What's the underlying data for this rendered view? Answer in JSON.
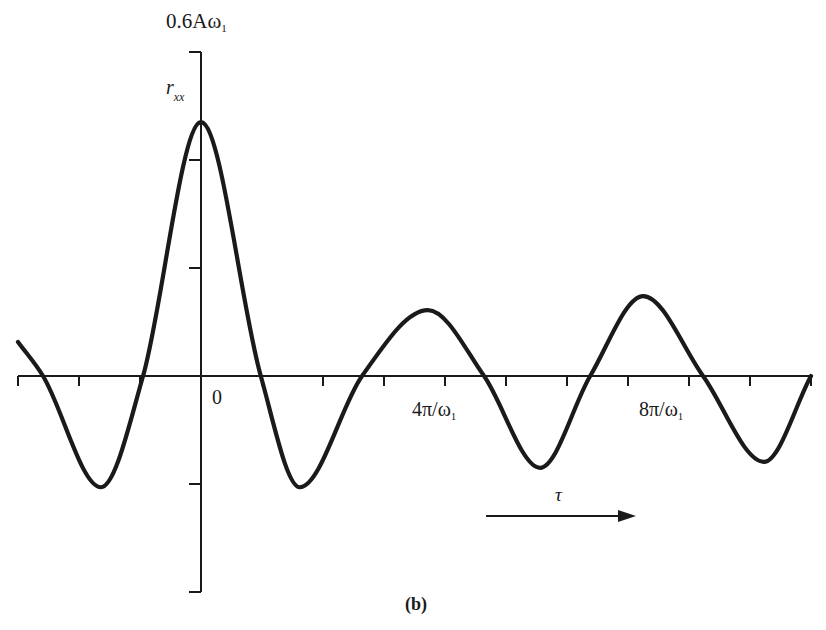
{
  "chart_data": {
    "type": "line",
    "title": "",
    "caption": "(b)",
    "ylabel": "r_xx",
    "xlabel": "τ",
    "y_top_label": "0.6Aω₁",
    "x_origin_label": "0",
    "x_tick_labels": [
      {
        "at": 4,
        "label": "4π/ω₁"
      },
      {
        "at": 8,
        "label": "8π/ω₁"
      }
    ],
    "x_units": "π/ω₁",
    "y_units": "Aω₁",
    "xlim": [
      -3,
      10
    ],
    "ylim": [
      -0.4,
      0.6
    ],
    "x_ticks": [
      -3,
      -2,
      -1,
      0,
      1,
      2,
      3,
      4,
      5,
      6,
      7,
      8,
      9,
      10
    ],
    "y_ticks": [
      -0.4,
      -0.2,
      0,
      0.2,
      0.4,
      0.6
    ],
    "grid": false,
    "legend": null,
    "series": [
      {
        "name": "r_xx(τ)",
        "x": [
          -3.0,
          -2.59,
          -1.64,
          -0.95,
          0.0,
          0.98,
          1.62,
          2.64,
          3.72,
          4.64,
          5.56,
          6.38,
          7.25,
          8.23,
          9.23,
          10.0
        ],
        "y": [
          0.063,
          0.0,
          -0.206,
          0.0,
          0.47,
          0.0,
          -0.206,
          0.0,
          0.122,
          0.0,
          -0.17,
          0.0,
          0.148,
          0.0,
          -0.159,
          0.0
        ]
      }
    ],
    "annotations": [
      {
        "text": "τ",
        "type": "arrow",
        "direction": "right",
        "from_x": 4.7,
        "to_x": 7.1,
        "y": -0.26
      }
    ]
  },
  "labels": {
    "y_top": "0.6Aω",
    "y_top_sub": "1",
    "y_axis": "r",
    "y_axis_sub": "xx",
    "origin": "0",
    "x_tick_4_main": "4π/ω",
    "x_tick_4_sub": "1",
    "x_tick_8_main": "8π/ω",
    "x_tick_8_sub": "1",
    "tau": "τ",
    "caption": "(b)"
  }
}
